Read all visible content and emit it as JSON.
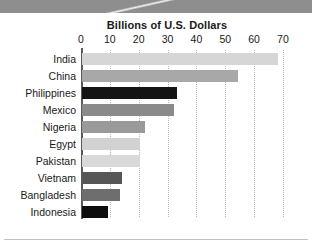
{
  "chart_data": {
    "type": "bar",
    "orientation": "horizontal",
    "title": "Billions of U.S. Dollars",
    "xlabel": "",
    "ylabel": "",
    "xlim": [
      0,
      73
    ],
    "xticks": [
      0,
      10,
      20,
      30,
      40,
      50,
      60,
      70
    ],
    "grid": true,
    "legend": "none",
    "categories": [
      "India",
      "China",
      "Philippines",
      "Mexico",
      "Nigeria",
      "Egypt",
      "Pakistan",
      "Vietnam",
      "Bangladesh",
      "Indonesia"
    ],
    "values": [
      68,
      54,
      33,
      32,
      22,
      20,
      20,
      14,
      13,
      9
    ],
    "bar_colors": [
      "#d6d6d6",
      "#a8a8a8",
      "#141414",
      "#8a8a8a",
      "#9a9a9a",
      "#d2d2d2",
      "#d9d9d9",
      "#565656",
      "#6e6e6e",
      "#0d0d0d"
    ],
    "axis_color": "#5a5a5a",
    "gridline_color": "#b9b9b9"
  },
  "header": {
    "band_color": "#8e8e8e"
  }
}
